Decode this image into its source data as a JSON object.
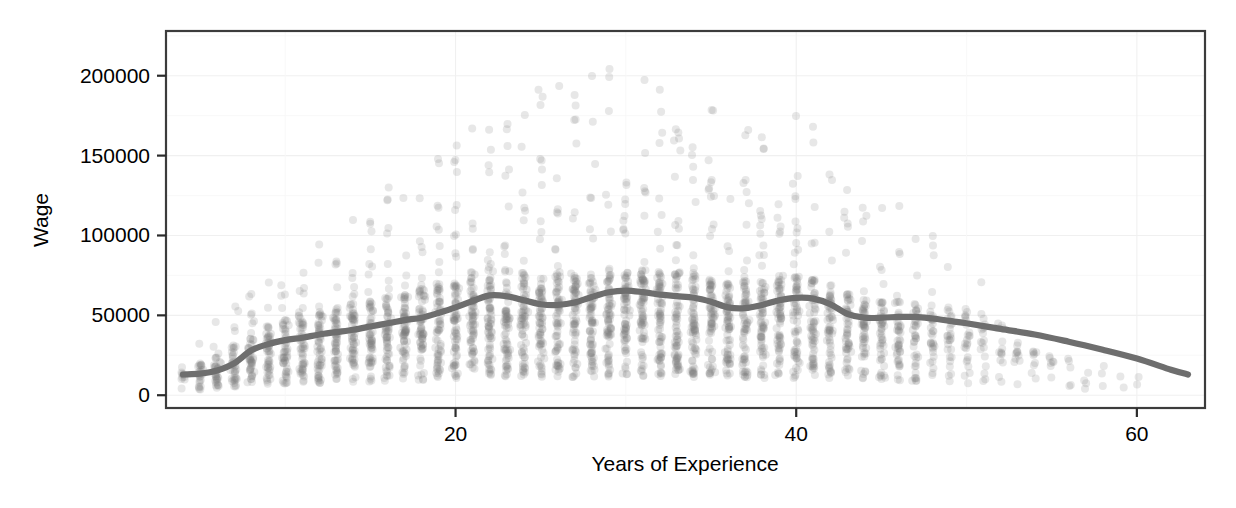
{
  "chart_data": {
    "type": "scatter",
    "title": "",
    "subtitle": "",
    "xlabel": "Years of Experience",
    "ylabel": "Wage",
    "xlim": [
      3,
      64
    ],
    "ylim": [
      -8000,
      228000
    ],
    "x_ticks": [
      20,
      40,
      60
    ],
    "x_tick_labels": [
      "20",
      "40",
      "60"
    ],
    "y_ticks": [
      0,
      50000,
      100000,
      150000,
      200000
    ],
    "y_tick_labels": [
      "0",
      "50000",
      "100000",
      "150000",
      "200000"
    ],
    "grid": true,
    "legend": "none",
    "point_color": "#7a7a7a",
    "point_alpha": 0.18,
    "point_radius": 4,
    "line_color": "#6e6e6e",
    "panel_background": "#ffffff",
    "series": [
      {
        "name": "Wage observations",
        "type": "scatter",
        "note": "Semi-transparent grey points, one column per integer year of experience, heavy overplotting below 100000"
      },
      {
        "name": "LOESS smooth",
        "type": "line",
        "x": [
          4,
          5,
          6,
          7,
          8,
          9,
          10,
          11,
          12,
          13,
          14,
          15,
          16,
          17,
          18,
          19,
          20,
          21,
          22,
          23,
          24,
          25,
          26,
          27,
          28,
          29,
          30,
          31,
          32,
          33,
          34,
          35,
          36,
          37,
          38,
          39,
          40,
          41,
          42,
          43,
          44,
          45,
          46,
          47,
          48,
          49,
          50,
          52,
          54,
          56,
          58,
          60,
          62,
          63
        ],
        "y": [
          13000,
          13500,
          15500,
          20000,
          28000,
          32000,
          34500,
          36000,
          38000,
          39500,
          41000,
          43000,
          45000,
          47000,
          48500,
          51500,
          55000,
          59000,
          62500,
          62000,
          59500,
          57000,
          56500,
          58000,
          61500,
          64500,
          65500,
          64500,
          63000,
          62000,
          61000,
          58500,
          55000,
          54500,
          56500,
          59500,
          61000,
          60500,
          57000,
          51000,
          48500,
          48500,
          49000,
          49000,
          48000,
          46500,
          45000,
          41500,
          38000,
          33500,
          28500,
          23000,
          16000,
          13000
        ]
      }
    ],
    "scatter_columns": [
      {
        "x": 4,
        "count": 10,
        "median": 9000,
        "max": 38000
      },
      {
        "x": 5,
        "count": 26,
        "median": 11000,
        "max": 52000
      },
      {
        "x": 6,
        "count": 34,
        "median": 14000,
        "max": 62000
      },
      {
        "x": 7,
        "count": 40,
        "median": 18000,
        "max": 72000
      },
      {
        "x": 8,
        "count": 46,
        "median": 22000,
        "max": 86000
      },
      {
        "x": 9,
        "count": 50,
        "median": 25000,
        "max": 92000
      },
      {
        "x": 10,
        "count": 54,
        "median": 27000,
        "max": 96000
      },
      {
        "x": 11,
        "count": 56,
        "median": 29000,
        "max": 101000
      },
      {
        "x": 12,
        "count": 58,
        "median": 30000,
        "max": 104000
      },
      {
        "x": 13,
        "count": 60,
        "median": 31000,
        "max": 110000
      },
      {
        "x": 14,
        "count": 62,
        "median": 33000,
        "max": 118000
      },
      {
        "x": 15,
        "count": 64,
        "median": 34000,
        "max": 124000
      },
      {
        "x": 16,
        "count": 66,
        "median": 36000,
        "max": 131000
      },
      {
        "x": 17,
        "count": 68,
        "median": 37000,
        "max": 138000
      },
      {
        "x": 18,
        "count": 70,
        "median": 38000,
        "max": 146000
      },
      {
        "x": 19,
        "count": 72,
        "median": 40000,
        "max": 152000
      },
      {
        "x": 20,
        "count": 74,
        "median": 42000,
        "max": 158000
      },
      {
        "x": 21,
        "count": 76,
        "median": 44000,
        "max": 168000
      },
      {
        "x": 22,
        "count": 76,
        "median": 45000,
        "max": 176000
      },
      {
        "x": 23,
        "count": 76,
        "median": 45000,
        "max": 182000
      },
      {
        "x": 24,
        "count": 76,
        "median": 44000,
        "max": 188000
      },
      {
        "x": 25,
        "count": 76,
        "median": 43000,
        "max": 192000
      },
      {
        "x": 26,
        "count": 76,
        "median": 43000,
        "max": 196000
      },
      {
        "x": 27,
        "count": 76,
        "median": 44000,
        "max": 200000
      },
      {
        "x": 28,
        "count": 78,
        "median": 45000,
        "max": 205000
      },
      {
        "x": 29,
        "count": 78,
        "median": 46000,
        "max": 208000
      },
      {
        "x": 30,
        "count": 78,
        "median": 46000,
        "max": 204000
      },
      {
        "x": 31,
        "count": 78,
        "median": 45000,
        "max": 198000
      },
      {
        "x": 32,
        "count": 78,
        "median": 45000,
        "max": 194000
      },
      {
        "x": 33,
        "count": 78,
        "median": 44000,
        "max": 190000
      },
      {
        "x": 34,
        "count": 76,
        "median": 43000,
        "max": 186000
      },
      {
        "x": 35,
        "count": 76,
        "median": 42000,
        "max": 182000
      },
      {
        "x": 36,
        "count": 74,
        "median": 41000,
        "max": 178000
      },
      {
        "x": 37,
        "count": 74,
        "median": 41000,
        "max": 174000
      },
      {
        "x": 38,
        "count": 72,
        "median": 42000,
        "max": 176000
      },
      {
        "x": 39,
        "count": 72,
        "median": 43000,
        "max": 180000
      },
      {
        "x": 40,
        "count": 70,
        "median": 43000,
        "max": 184000
      },
      {
        "x": 41,
        "count": 66,
        "median": 42000,
        "max": 172000
      },
      {
        "x": 42,
        "count": 62,
        "median": 40000,
        "max": 160000
      },
      {
        "x": 43,
        "count": 58,
        "median": 37000,
        "max": 150000
      },
      {
        "x": 44,
        "count": 54,
        "median": 35000,
        "max": 142000
      },
      {
        "x": 45,
        "count": 50,
        "median": 34000,
        "max": 136000
      },
      {
        "x": 46,
        "count": 46,
        "median": 34000,
        "max": 128000
      },
      {
        "x": 47,
        "count": 40,
        "median": 33000,
        "max": 118000
      },
      {
        "x": 48,
        "count": 34,
        "median": 32000,
        "max": 108000
      },
      {
        "x": 49,
        "count": 28,
        "median": 31000,
        "max": 98000
      },
      {
        "x": 50,
        "count": 24,
        "median": 30000,
        "max": 88000
      },
      {
        "x": 51,
        "count": 18,
        "median": 28000,
        "max": 78000
      },
      {
        "x": 52,
        "count": 14,
        "median": 26000,
        "max": 66000
      },
      {
        "x": 53,
        "count": 11,
        "median": 24000,
        "max": 58000
      },
      {
        "x": 54,
        "count": 9,
        "median": 22000,
        "max": 52000
      },
      {
        "x": 55,
        "count": 7,
        "median": 20000,
        "max": 46000
      },
      {
        "x": 56,
        "count": 5,
        "median": 18000,
        "max": 40000
      },
      {
        "x": 57,
        "count": 4,
        "median": 16000,
        "max": 34000
      },
      {
        "x": 58,
        "count": 3,
        "median": 15000,
        "max": 28000
      },
      {
        "x": 59,
        "count": 2,
        "median": 14000,
        "max": 24000
      },
      {
        "x": 60,
        "count": 2,
        "median": 13000,
        "max": 20000
      }
    ]
  }
}
